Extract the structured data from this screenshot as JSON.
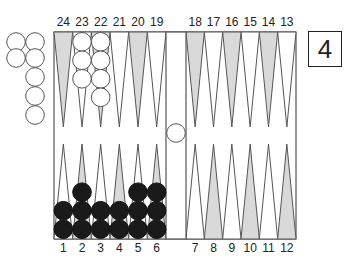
{
  "diagram": {
    "type": "backgammon-board",
    "colors": {
      "shaded_point": "#d9d9d9",
      "white_point": "#ffffff",
      "outline": "#555555",
      "black_checker": "#1a1a1a",
      "white_checker": "#ffffff"
    },
    "top_labels": [
      "24",
      "23",
      "22",
      "21",
      "20",
      "19",
      "18",
      "17",
      "16",
      "15",
      "14",
      "13"
    ],
    "bottom_labels": [
      "1",
      "2",
      "3",
      "4",
      "5",
      "6",
      "7",
      "8",
      "9",
      "10",
      "11",
      "12"
    ],
    "shaded_points": [
      24,
      22,
      20,
      18,
      16,
      14,
      2,
      4,
      6,
      8,
      10,
      12
    ],
    "checkers": {
      "white": {
        "point_23": 3,
        "point_22": 4,
        "bar": 1,
        "borne_off": 7
      },
      "black": {
        "point_1": 2,
        "point_2": 3,
        "point_3": 2,
        "point_4": 2,
        "point_5": 3,
        "point_6": 3
      }
    },
    "cube": {
      "value": "4"
    }
  }
}
